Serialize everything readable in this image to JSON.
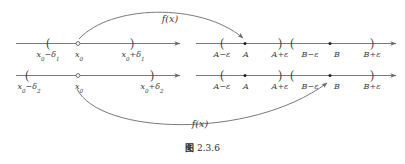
{
  "figure": {
    "caption_cjk": "图",
    "caption_number": "2.3.6",
    "line_color": "#6b6b6b",
    "text_color": "#3c3c3c",
    "background": "#ffffff"
  },
  "mappings": [
    {
      "id": "top",
      "label": "f(x)"
    },
    {
      "id": "bottom",
      "label": "f(x)"
    }
  ],
  "axes": [
    {
      "id": "domain-line-1",
      "side": "left",
      "row": "top",
      "ticks": [
        {
          "kind": "paren-open",
          "glyph": "(",
          "label_html": "x<sub>0</sub>&#8722;&#948;<sub>1</sub>",
          "label_text": "x0-delta1"
        },
        {
          "kind": "open-circle",
          "glyph": "○",
          "label_html": "x<sub>0</sub>",
          "label_text": "x0"
        },
        {
          "kind": "paren-close",
          "glyph": ")",
          "label_html": "x<sub>0</sub>+&#948;<sub>1</sub>",
          "label_text": "x0+delta1"
        }
      ]
    },
    {
      "id": "range-line-1",
      "side": "right",
      "row": "top",
      "ticks": [
        {
          "kind": "paren-open",
          "glyph": "(",
          "label_html": "A&#8722;&#949;",
          "label_text": "A-epsilon"
        },
        {
          "kind": "filled-dot",
          "glyph": "•",
          "label_html": "A",
          "label_text": "A"
        },
        {
          "kind": "paren-close",
          "glyph": ")",
          "label_html": "A+&#949;",
          "label_text": "A+epsilon"
        },
        {
          "kind": "paren-open",
          "glyph": "(",
          "label_html": "B&#8722;&#949;",
          "label_text": "B-epsilon"
        },
        {
          "kind": "filled-dot",
          "glyph": "•",
          "label_html": "B",
          "label_text": "B"
        },
        {
          "kind": "paren-close",
          "glyph": ")",
          "label_html": "B+&#949;",
          "label_text": "B+epsilon"
        }
      ]
    },
    {
      "id": "domain-line-2",
      "side": "left",
      "row": "bottom",
      "ticks": [
        {
          "kind": "paren-open",
          "glyph": "(",
          "label_html": "x<sub>0</sub>&#8722;&#948;<sub>2</sub>",
          "label_text": "x0-delta2"
        },
        {
          "kind": "open-circle",
          "glyph": "○",
          "label_html": "x<sub>0</sub>",
          "label_text": "x0"
        },
        {
          "kind": "paren-close",
          "glyph": ")",
          "label_html": "x<sub>0</sub>+&#948;<sub>2</sub>",
          "label_text": "x0+delta2"
        }
      ]
    },
    {
      "id": "range-line-2",
      "side": "right",
      "row": "bottom",
      "ticks": [
        {
          "kind": "paren-open",
          "glyph": "(",
          "label_html": "A&#8722;&#949;",
          "label_text": "A-epsilon"
        },
        {
          "kind": "filled-dot",
          "glyph": "•",
          "label_html": "A",
          "label_text": "A"
        },
        {
          "kind": "paren-close",
          "glyph": ")",
          "label_html": "A+&#949;",
          "label_text": "A+epsilon"
        },
        {
          "kind": "paren-open",
          "glyph": "(",
          "label_html": "B&#8722;&#949;",
          "label_text": "B-epsilon"
        },
        {
          "kind": "filled-dot",
          "glyph": "•",
          "label_html": "B",
          "label_text": "B"
        },
        {
          "kind": "paren-close",
          "glyph": ")",
          "label_html": "B+&#949;",
          "label_text": "B+epsilon"
        }
      ]
    }
  ]
}
